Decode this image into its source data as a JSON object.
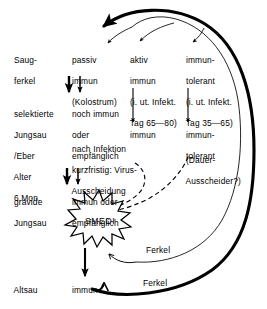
{
  "figure": {
    "background_color": "#ffffff",
    "ink_color": "#000000",
    "width": 267,
    "height": 309
  },
  "stages": [
    {
      "id": "saugferkel",
      "lines": [
        "Saug-",
        "ferkel"
      ]
    },
    {
      "id": "jungsau",
      "lines": [
        "selektierte",
        "Jungsau",
        "/Eber",
        "Alter",
        "6 Mon."
      ]
    },
    {
      "id": "gravide",
      "lines": [
        "gravide",
        "Jungsau"
      ]
    },
    {
      "id": "altsau",
      "lines": [
        "Altsau"
      ]
    }
  ],
  "columns": {
    "column1": {
      "row_saugferkel": [
        "passiv",
        "immun",
        "(Kolostrum)"
      ],
      "row_jungsau": [
        "noch immun",
        "oder",
        "empfänglich"
      ],
      "row_jungsau_note": [
        "nach Infektion",
        "kurzfristig: Virus-",
        "Ausscheidung"
      ],
      "row_gravide": [
        "immun oder",
        "empfänglich"
      ],
      "row_altsau": [
        "immun"
      ]
    },
    "column2": {
      "row_saugferkel": [
        "aktiv",
        "immun",
        "(i. ut. Infekt.",
        "Tag 65—80)"
      ],
      "row_jungsau": [
        "immun"
      ]
    },
    "column3": {
      "row_saugferkel": [
        "immun-",
        "tolerant",
        "(i. ut. Infekt.",
        "Tag 35—65)"
      ],
      "row_jungsau": [
        "immun-",
        "tolerant"
      ],
      "row_jungsau_note": [
        "(Dauer-",
        "Ausscheider?)"
      ]
    }
  },
  "event": {
    "label": "SMEDI",
    "shape": "starburst"
  },
  "feedback_labels": [
    {
      "id": "ferkel-upper",
      "text": "Ferkel"
    },
    {
      "id": "ferkel-lower",
      "text": "Ferkel"
    }
  ],
  "edges": {
    "thick_return_arc": "from Altsau Ferkel output around right side to passiv immun",
    "thin_return_arc": "from gravide/immun Ferkel output around right side to aktiv immun and immun-tolerant",
    "vertical_column1_pair": "double arrow passiv immun -> noch immun oder empfänglich",
    "vertical_column1_pair2": "double arrow Ausscheidung -> immun oder empfänglich",
    "vertical_column2": "aktiv immun -> immun",
    "vertical_column3": "immun-tolerant -> immun-tolerant",
    "dashed_to_smedi_left": "Virus-Ausscheidung -> SMEDI (dashed)",
    "dashed_to_smedi_right": "Dauer-Ausscheider? -> SMEDI (dashed)",
    "smedi_to_immun": "SMEDI -> immun (Altsau)"
  }
}
